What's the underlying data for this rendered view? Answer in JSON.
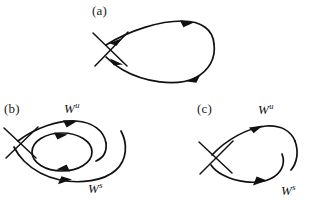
{
  "figure": {
    "width": 321,
    "height": 203,
    "background_color": "#ffffff",
    "stroke_color": "#111111"
  },
  "panels": [
    {
      "id": "a",
      "label": "(a)",
      "description": "homoclinic-loop-saddle",
      "manifold_labels": []
    },
    {
      "id": "b",
      "label": "(b)",
      "description": "saddle-with-nested-periodic-orbit-and-broken-separatrix",
      "manifold_labels": [
        {
          "name": "W",
          "superscript": "u",
          "position": "upper-left"
        },
        {
          "name": "W",
          "superscript": "s",
          "position": "lower-right"
        }
      ]
    },
    {
      "id": "c",
      "label": "(c)",
      "description": "saddle-with-broken-separatrix-loop",
      "manifold_labels": [
        {
          "name": "W",
          "superscript": "u",
          "position": "upper-right"
        },
        {
          "name": "W",
          "superscript": "s",
          "position": "lower-right"
        }
      ]
    }
  ],
  "labels": {
    "panel_a": "(a)",
    "panel_b": "(b)",
    "panel_c": "(c)",
    "w_letter": "W",
    "unstable_sup": "u",
    "stable_sup": "s"
  }
}
